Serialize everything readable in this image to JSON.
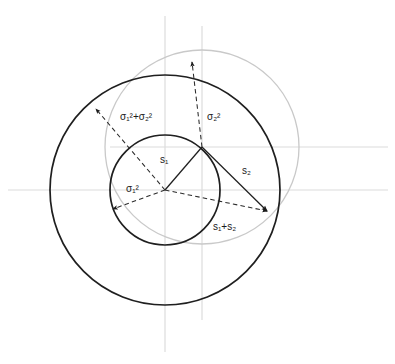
{
  "figure": {
    "background_color": "#ffffff",
    "width": 395,
    "height": 364,
    "colors": {
      "dark_stroke": "#1a1a1a",
      "light_stroke": "#c8c8c8",
      "axis": "#d8d8d8",
      "dashed": "#333333",
      "label_text": "#1a1a1a"
    },
    "axes": [
      {
        "name": "horizontal-axis-main",
        "orientation": "horizontal",
        "position": 190
      },
      {
        "name": "horizontal-axis-secondary",
        "orientation": "horizontal",
        "position": 147
      },
      {
        "name": "vertical-axis-main",
        "orientation": "vertical",
        "position": 165
      },
      {
        "name": "vertical-axis-secondary",
        "orientation": "vertical",
        "position": 202
      }
    ],
    "circles": [
      {
        "name": "inner-circle-sigma1",
        "cx": 165,
        "cy": 190,
        "r": 55,
        "stroke": "dark",
        "label_ref": "sigma1_sq"
      },
      {
        "name": "outer-circle-sigma-sum",
        "cx": 165,
        "cy": 190,
        "r": 115,
        "stroke": "dark",
        "label_ref": "sigma_sum_sq"
      },
      {
        "name": "offset-circle-sigma2",
        "cx": 202,
        "cy": 147,
        "r": 97,
        "stroke": "light",
        "label_ref": "sigma2_sq"
      }
    ],
    "points": {
      "origin": {
        "name": "origin-point",
        "x": 165,
        "y": 190
      },
      "p1": {
        "name": "point-p1-on-inner-circle",
        "x": 202,
        "y": 147
      },
      "p2": {
        "name": "point-p2-resultant",
        "x": 268,
        "y": 212
      }
    },
    "solid_vectors": [
      {
        "name": "vector-s1",
        "from": "origin",
        "to": "p1",
        "label_ref": "s1"
      },
      {
        "name": "vector-s2",
        "from": "p1",
        "to": "p2",
        "label_ref": "s2"
      }
    ],
    "dashed_arrows": [
      {
        "name": "arrow-sigma1-sq",
        "label_ref": "sigma1_sq"
      },
      {
        "name": "arrow-sigma2-sq",
        "label_ref": "sigma2_sq"
      },
      {
        "name": "arrow-sigma-sum-sq",
        "label_ref": "sigma_sum_sq"
      },
      {
        "name": "arrow-s1-plus-s2",
        "label_ref": "s1_plus_s2"
      }
    ]
  },
  "labels": {
    "sigma_sum_sq": {
      "text": "σ₁²+σ₂²",
      "x": 120,
      "y": 112
    },
    "sigma2_sq": {
      "text": "σ₂²",
      "x": 207,
      "y": 112
    },
    "sigma1_sq": {
      "text": "σ₁²",
      "x": 126,
      "y": 184
    },
    "s1": {
      "text": "s₁",
      "x": 160,
      "y": 155
    },
    "s2": {
      "text": "s₂",
      "x": 242,
      "y": 166
    },
    "s1_plus_s2": {
      "text": "s₁+s₂",
      "x": 213,
      "y": 222
    }
  }
}
